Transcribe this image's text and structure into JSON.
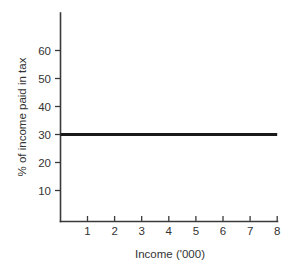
{
  "chart_data": {
    "type": "line",
    "title": "",
    "subtitle": "",
    "xlabel": "Income ('000)",
    "ylabel": "% of income paid in tax",
    "xlim": [
      0,
      8.2
    ],
    "ylim": [
      0,
      68
    ],
    "xticks": [
      1,
      2,
      3,
      4,
      5,
      6,
      7,
      8
    ],
    "xtick_labels": [
      "1",
      "2",
      "3",
      "4",
      "5",
      "6",
      "7",
      "8"
    ],
    "yticks": [
      10,
      20,
      30,
      40,
      50,
      60
    ],
    "ytick_labels": [
      "10",
      "20",
      "30",
      "40",
      "50",
      "60"
    ],
    "grid": false,
    "legend": null,
    "annotations": [],
    "series": [
      {
        "name": "Flat tax rate",
        "color": "#1a1a1a",
        "x": [
          0.0,
          8.0
        ],
        "values": [
          30,
          30
        ]
      }
    ]
  },
  "axis": {
    "x_label": "Income ('000)",
    "y_label": "% of income paid in tax",
    "y_tick_10": "10",
    "y_tick_20": "20",
    "y_tick_30": "30",
    "y_tick_40": "40",
    "y_tick_50": "50",
    "y_tick_60": "60",
    "x_tick_1": "1",
    "x_tick_2": "2",
    "x_tick_3": "3",
    "x_tick_4": "4",
    "x_tick_5": "5",
    "x_tick_6": "6",
    "x_tick_7": "7",
    "x_tick_8": "8"
  },
  "colors": {
    "background": "#ffffff",
    "axis": "#3a3a3a",
    "series": "#1a1a1a",
    "text": "#333333"
  }
}
